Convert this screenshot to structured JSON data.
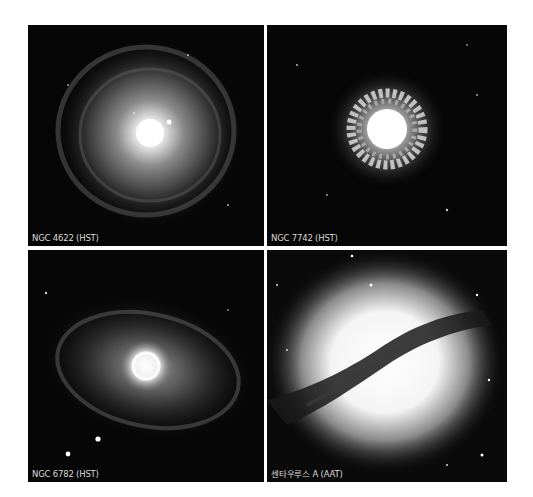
{
  "figure": {
    "panels": [
      {
        "id": "ngc4622",
        "caption": "NGC 4622 (HST)",
        "description": "face-on spiral galaxy with bright core and faint outer ring"
      },
      {
        "id": "ngc7742",
        "caption": "NGC 7742 (HST)",
        "description": "galaxy with bright core and clumpy star-forming ring"
      },
      {
        "id": "ngc6782",
        "caption": "NGC 6782 (HST)",
        "description": "barred spiral with elliptical outer ring and bright nuclear ring"
      },
      {
        "id": "centaurus-a",
        "caption": "센타우루스 A (AAT)",
        "description": "elliptical galaxy with dark diagonal dust lane"
      }
    ]
  }
}
